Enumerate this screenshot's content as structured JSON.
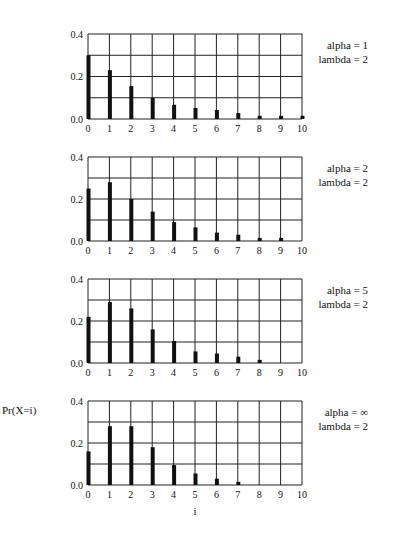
{
  "figure": {
    "ylabel": "Pr(X=i)",
    "xlabel": "i"
  },
  "chart_data": [
    {
      "type": "bar",
      "title": "alpha = 1, lambda = 2",
      "params": {
        "alpha_label": "alpha = 1",
        "lambda_label": "lambda = 2"
      },
      "categories": [
        "0",
        "1",
        "2",
        "3",
        "4",
        "5",
        "6",
        "7",
        "8",
        "9",
        "10"
      ],
      "values": [
        0.3,
        0.23,
        0.155,
        0.1,
        0.067,
        0.052,
        0.042,
        0.028,
        0.015,
        0.015,
        0.015
      ],
      "xlabel": "",
      "ylabel": "",
      "ylim": [
        0,
        0.4
      ],
      "yticks": [
        "0.0",
        "0.2",
        "0.4"
      ],
      "grid": true
    },
    {
      "type": "bar",
      "title": "alpha = 2, lambda = 2",
      "params": {
        "alpha_label": "alpha = 2",
        "lambda_label": "lambda = 2"
      },
      "categories": [
        "0",
        "1",
        "2",
        "3",
        "4",
        "5",
        "6",
        "7",
        "8",
        "9",
        "10"
      ],
      "values": [
        0.25,
        0.28,
        0.2,
        0.14,
        0.09,
        0.065,
        0.04,
        0.03,
        0.015,
        0.015,
        0.0
      ],
      "xlabel": "",
      "ylabel": "",
      "ylim": [
        0,
        0.4
      ],
      "yticks": [
        "0.0",
        "0.2",
        "0.4"
      ],
      "grid": true
    },
    {
      "type": "bar",
      "title": "alpha = 5, lambda = 2",
      "params": {
        "alpha_label": "alpha = 5",
        "lambda_label": "lambda = 2"
      },
      "categories": [
        "0",
        "1",
        "2",
        "3",
        "4",
        "5",
        "6",
        "7",
        "8",
        "9",
        "10"
      ],
      "values": [
        0.22,
        0.29,
        0.26,
        0.16,
        0.105,
        0.055,
        0.045,
        0.03,
        0.015,
        0.0,
        0.0
      ],
      "xlabel": "",
      "ylabel": "",
      "ylim": [
        0,
        0.4
      ],
      "yticks": [
        "0.0",
        "0.2",
        "0.4"
      ],
      "grid": true
    },
    {
      "type": "bar",
      "title": "alpha = ∞, lambda = 2",
      "params": {
        "alpha_label": "alpha = ∞",
        "lambda_label": "lambda = 2"
      },
      "categories": [
        "0",
        "1",
        "2",
        "3",
        "4",
        "5",
        "6",
        "7",
        "8",
        "9",
        "10"
      ],
      "values": [
        0.16,
        0.28,
        0.28,
        0.18,
        0.095,
        0.055,
        0.03,
        0.015,
        0.0,
        0.0,
        0.0
      ],
      "xlabel": "i",
      "ylabel": "Pr(X=i)",
      "ylim": [
        0,
        0.4
      ],
      "yticks": [
        "0.0",
        "0.2",
        "0.4"
      ],
      "grid": true
    }
  ],
  "style": {
    "bar_color": "#111111",
    "grid_color": "#222222",
    "background": "#ffffff"
  }
}
